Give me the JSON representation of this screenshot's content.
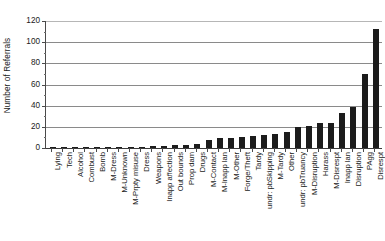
{
  "chart_data": {
    "type": "bar",
    "title": "",
    "xlabel": "",
    "ylabel": "Number of Referrals",
    "ylim": [
      0,
      120
    ],
    "yticks": [
      0,
      20,
      40,
      60,
      80,
      100,
      120
    ],
    "ytick_labels": [
      "0",
      "20",
      "40",
      "60",
      "80",
      "100",
      "120"
    ],
    "grid": true,
    "legend": false,
    "orientation": "vertical",
    "bar_color": "#1c1c1c",
    "categories": [
      "Lying",
      "Tech",
      "Alcohol",
      "Combust",
      "Bomb",
      "M-Dress",
      "M-Unknown",
      "M-Prpty misuse",
      "Dress",
      "Weapons",
      "Inapp affection",
      "Out bounds",
      "Prop dam",
      "Drugs",
      "M-Contact",
      "M-Inapp lan",
      "M-Other",
      "Forge/Theft",
      "Tardy",
      "undr: pbSkipping",
      "M-Tardy",
      "Other",
      "undr: pbTruancy",
      "M-Disruption",
      "Harass",
      "M-Disrespt",
      "Inapp lan",
      "Disruption",
      "PAgg",
      "Disrespt"
    ],
    "values": [
      1,
      1,
      1,
      1,
      1,
      1,
      1,
      1,
      1,
      2,
      2,
      3,
      3,
      4,
      8,
      9,
      9,
      10,
      11,
      12,
      13,
      15,
      20,
      21,
      24,
      24,
      33,
      39,
      70,
      112
    ]
  }
}
